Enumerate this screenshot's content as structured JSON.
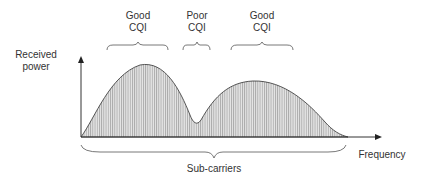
{
  "diagram": {
    "y_axis_label_line1": "Received",
    "y_axis_label_line2": "power",
    "x_axis_label": "Frequency",
    "bottom_brace_label": "Sub-carriers",
    "regions": [
      {
        "line1": "Good",
        "line2": "CQI"
      },
      {
        "line1": "Poor",
        "line2": "CQI"
      },
      {
        "line1": "Good",
        "line2": "CQI"
      }
    ],
    "colors": {
      "fill": "#c8c8c8",
      "stroke": "#333333",
      "text": "#333333"
    }
  }
}
